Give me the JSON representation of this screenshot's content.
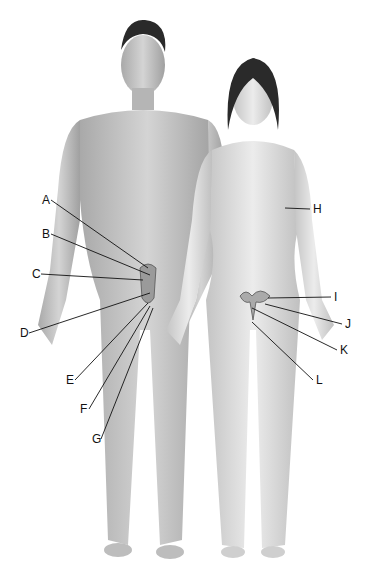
{
  "figure": {
    "labels": [
      {
        "id": "A",
        "x": 42,
        "y": 194,
        "tx": 148,
        "ty": 268
      },
      {
        "id": "B",
        "x": 42,
        "y": 228,
        "tx": 150,
        "ty": 275
      },
      {
        "id": "C",
        "x": 32,
        "y": 268,
        "tx": 143,
        "ty": 280
      },
      {
        "id": "D",
        "x": 20,
        "y": 327,
        "tx": 150,
        "ty": 293
      },
      {
        "id": "E",
        "x": 66,
        "y": 374,
        "tx": 148,
        "ty": 303
      },
      {
        "id": "F",
        "x": 80,
        "y": 403,
        "tx": 150,
        "ty": 306
      },
      {
        "id": "G",
        "x": 92,
        "y": 433,
        "tx": 153,
        "ty": 308
      },
      {
        "id": "H",
        "x": 313,
        "y": 203,
        "tx": 285,
        "ty": 208
      },
      {
        "id": "I",
        "x": 334,
        "y": 291,
        "tx": 268,
        "ty": 298
      },
      {
        "id": "J",
        "x": 345,
        "y": 318,
        "tx": 265,
        "ty": 304
      },
      {
        "id": "K",
        "x": 340,
        "y": 344,
        "tx": 252,
        "ty": 308
      },
      {
        "id": "L",
        "x": 316,
        "y": 374,
        "tx": 252,
        "ty": 322
      }
    ]
  },
  "colors": {
    "skin_male": "#c9c9c9",
    "skin_female": "#dedede",
    "hair": "#2a2a2a",
    "line": "#111111"
  }
}
